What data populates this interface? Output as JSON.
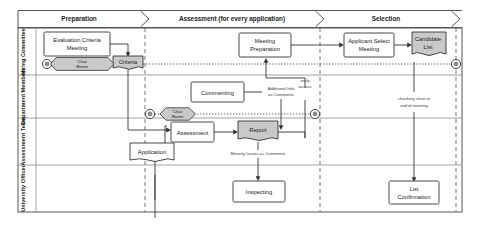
{
  "diagram": {
    "type": "bpmn-process-diagram"
  },
  "phases": [
    {
      "id": "preparation",
      "label": "Preparation"
    },
    {
      "id": "assessment",
      "label": "Assessment (for every application)"
    },
    {
      "id": "selection",
      "label": "Selection"
    }
  ],
  "lanes": [
    {
      "id": "hiring-committee",
      "label": "Hiring Committee"
    },
    {
      "id": "department-members",
      "label": "Department Members"
    },
    {
      "id": "assessment-team",
      "label": "Assessment Team"
    },
    {
      "id": "university-officer",
      "label": "University Officer"
    }
  ],
  "tasks": {
    "evaluation_criteria_meeting_line1": "Evaluation Criteria",
    "evaluation_criteria_meeting_line2": "Meeting",
    "meeting_preparation_line1": "Meeting",
    "meeting_preparation_line2": "Preparation",
    "applicant_select_meeting_line1": "Applicant Select",
    "applicant_select_meeting_line2": "Meeting",
    "commenting": "Commenting",
    "assessment": "Assessment",
    "inspecting": "Inspecting",
    "list_confirmation_line1": "List",
    "list_confirmation_line2": "Confirmation"
  },
  "artifacts": {
    "criteria": "Criteria",
    "candidate_list_line1": "Candidate",
    "candidate_list_line2": "List",
    "report": "Report",
    "application": "Application"
  },
  "chat_rooms": {
    "committee_chat_line1": "Chat",
    "committee_chat_line2": "Room",
    "department_chat_line1": "Chat",
    "department_chat_line2": "Room"
  },
  "annotations": {
    "additional_info_line1": "Additional Info",
    "additional_info_line2": "as Comments",
    "early_access_line1": "early",
    "early_access_line2": "access",
    "minority_issues": "Minority Issues as Comments",
    "checking_close_line1": "checking close to",
    "checking_close_line2": "end of meeting"
  },
  "colors": {
    "shaded_fill": "#c9c9c9",
    "stroke": "#333333",
    "lane_border": "#8a8a8a",
    "phase_divider": "#666666",
    "event_inner": "#8c8c8c"
  }
}
